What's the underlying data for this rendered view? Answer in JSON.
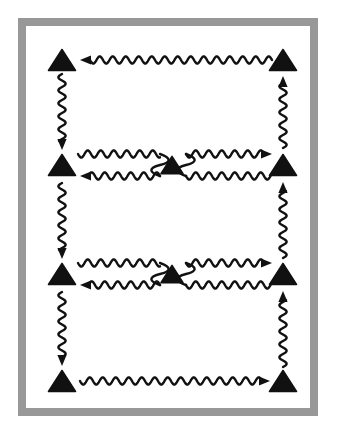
{
  "figure": {
    "canvas": {
      "width": 344,
      "height": 437
    },
    "colors": {
      "background": "#ffffff",
      "frame": "#989898",
      "frame_inner": "#ffffff",
      "ink": "#111111"
    },
    "frame": {
      "outer_x": 18,
      "outer_y": 18,
      "outer_width": 300,
      "outer_height": 398,
      "thickness": 8
    },
    "nodes": [
      {
        "id": "n-top-left",
        "label": "triangle-top-left",
        "x": 62,
        "y": 60,
        "size": 27
      },
      {
        "id": "n-top-right",
        "label": "triangle-top-right",
        "x": 283,
        "y": 60,
        "size": 27
      },
      {
        "id": "n-mid-left",
        "label": "triangle-middle-left",
        "x": 62,
        "y": 165,
        "size": 27
      },
      {
        "id": "n-mid-center",
        "label": "triangle-middle-center",
        "x": 172,
        "y": 165,
        "size": 22
      },
      {
        "id": "n-mid-right",
        "label": "triangle-middle-right",
        "x": 283,
        "y": 165,
        "size": 27
      },
      {
        "id": "n-low-left",
        "label": "triangle-lower-left",
        "x": 62,
        "y": 274,
        "size": 27
      },
      {
        "id": "n-low-center",
        "label": "triangle-lower-center",
        "x": 172,
        "y": 274,
        "size": 22
      },
      {
        "id": "n-low-right",
        "label": "triangle-lower-right",
        "x": 283,
        "y": 274,
        "size": 27
      },
      {
        "id": "n-bot-left",
        "label": "triangle-bottom-left",
        "x": 62,
        "y": 381,
        "size": 27
      },
      {
        "id": "n-bot-right",
        "label": "triangle-bottom-right",
        "x": 283,
        "y": 381,
        "size": 27
      }
    ],
    "wave": {
      "wavelength": 13,
      "amplitude": 3.6,
      "stroke_width": 2.4
    },
    "edges": [
      {
        "id": "e1",
        "label": "wave-top-row-right-to-left",
        "orientation": "horizontal",
        "direction": "left",
        "x1": 272,
        "y1": 60,
        "x2": 80,
        "y2": 60,
        "arrowhead": true
      },
      {
        "id": "e2",
        "label": "wave-left-col-top-down",
        "orientation": "vertical",
        "direction": "down",
        "x1": 62,
        "y1": 74,
        "x2": 62,
        "y2": 150,
        "arrowhead": true
      },
      {
        "id": "e3",
        "label": "wave-mid-row-left-out",
        "orientation": "horizontal",
        "direction": "right",
        "x1": 78,
        "y1": 154,
        "x2": 160,
        "y2": 154,
        "arrowhead": false
      },
      {
        "id": "e4",
        "label": "wave-mid-center-loop-left",
        "orientation": "connector",
        "direction": "down",
        "x1": 160,
        "y1": 154,
        "x2": 160,
        "y2": 176,
        "arrowhead": false
      },
      {
        "id": "e5",
        "label": "wave-mid-row-return-left",
        "orientation": "horizontal",
        "direction": "left",
        "x1": 160,
        "y1": 176,
        "x2": 80,
        "y2": 176,
        "arrowhead": true
      },
      {
        "id": "e6",
        "label": "wave-mid-center-loop-right",
        "orientation": "connector",
        "direction": "down",
        "x1": 186,
        "y1": 154,
        "x2": 186,
        "y2": 176,
        "arrowhead": false
      },
      {
        "id": "e7",
        "label": "wave-mid-row-right-upper",
        "orientation": "horizontal",
        "direction": "right",
        "x1": 186,
        "y1": 154,
        "x2": 272,
        "y2": 154,
        "arrowhead": true
      },
      {
        "id": "e8",
        "label": "wave-mid-row-right-lower",
        "orientation": "horizontal",
        "direction": "right",
        "x1": 186,
        "y1": 176,
        "x2": 272,
        "y2": 176,
        "arrowhead": false
      },
      {
        "id": "e9",
        "label": "wave-right-col-mid-up",
        "orientation": "vertical",
        "direction": "up",
        "x1": 283,
        "y1": 148,
        "x2": 283,
        "y2": 76,
        "arrowhead": true
      },
      {
        "id": "e10",
        "label": "wave-left-col-mid-down",
        "orientation": "vertical",
        "direction": "down",
        "x1": 62,
        "y1": 183,
        "x2": 62,
        "y2": 259,
        "arrowhead": true
      },
      {
        "id": "e11",
        "label": "wave-low-row-left-out",
        "orientation": "horizontal",
        "direction": "right",
        "x1": 78,
        "y1": 263,
        "x2": 160,
        "y2": 263,
        "arrowhead": false
      },
      {
        "id": "e12",
        "label": "wave-low-center-loop-left",
        "orientation": "connector",
        "direction": "down",
        "x1": 160,
        "y1": 263,
        "x2": 160,
        "y2": 285,
        "arrowhead": false
      },
      {
        "id": "e13",
        "label": "wave-low-row-return-left",
        "orientation": "horizontal",
        "direction": "left",
        "x1": 160,
        "y1": 285,
        "x2": 80,
        "y2": 285,
        "arrowhead": true
      },
      {
        "id": "e14",
        "label": "wave-low-center-loop-right",
        "orientation": "connector",
        "direction": "down",
        "x1": 186,
        "y1": 263,
        "x2": 186,
        "y2": 285,
        "arrowhead": false
      },
      {
        "id": "e15",
        "label": "wave-low-row-right-upper",
        "orientation": "horizontal",
        "direction": "right",
        "x1": 186,
        "y1": 263,
        "x2": 272,
        "y2": 263,
        "arrowhead": true
      },
      {
        "id": "e16",
        "label": "wave-low-row-right-lower",
        "orientation": "horizontal",
        "direction": "right",
        "x1": 186,
        "y1": 285,
        "x2": 272,
        "y2": 285,
        "arrowhead": false
      },
      {
        "id": "e17",
        "label": "wave-right-col-low-up",
        "orientation": "vertical",
        "direction": "up",
        "x1": 283,
        "y1": 258,
        "x2": 283,
        "y2": 182,
        "arrowhead": true
      },
      {
        "id": "e18",
        "label": "wave-left-col-bottom-down",
        "orientation": "vertical",
        "direction": "down",
        "x1": 62,
        "y1": 292,
        "x2": 62,
        "y2": 366,
        "arrowhead": true
      },
      {
        "id": "e19",
        "label": "wave-bottom-row-left-right",
        "orientation": "horizontal",
        "direction": "right",
        "x1": 80,
        "y1": 381,
        "x2": 270,
        "y2": 381,
        "arrowhead": true
      },
      {
        "id": "e20",
        "label": "wave-right-col-bottom-up",
        "orientation": "vertical",
        "direction": "up",
        "x1": 283,
        "y1": 367,
        "x2": 283,
        "y2": 291,
        "arrowhead": true
      }
    ]
  }
}
